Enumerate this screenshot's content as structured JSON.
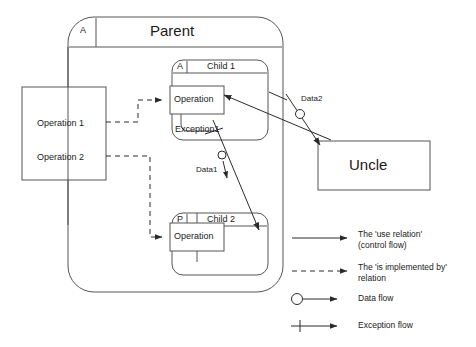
{
  "diagram": {
    "title_text": "Parent",
    "parent": {
      "label": "Parent",
      "tag": "A"
    },
    "children": [
      {
        "label": "Child 1",
        "tag": "A",
        "operation": "Operation",
        "exception": "Exception1"
      },
      {
        "label": "Child 2",
        "tag": "P",
        "operation": "Operation"
      }
    ],
    "uncle": {
      "label": "Uncle"
    },
    "operations_box": {
      "rows": [
        "Operation 1",
        "Operation 2"
      ]
    },
    "data_flows": [
      {
        "label": "Data1"
      },
      {
        "label": "Data2"
      }
    ]
  },
  "legend": {
    "items": [
      {
        "icon": "solid-arrow-icon",
        "line1": "The 'use relation'",
        "line2": "(control flow)"
      },
      {
        "icon": "dashed-arrow-icon",
        "line1": "The 'is implemented by'",
        "line2": "relation"
      },
      {
        "icon": "circle-arrow-icon",
        "line1": "Data flow",
        "line2": ""
      },
      {
        "icon": "tick-arrow-icon",
        "line1": "Exception flow",
        "line2": ""
      }
    ]
  },
  "colors": {
    "stroke": "#3a3a3a",
    "text": "#1a1a1a",
    "background": "#ffffff"
  }
}
